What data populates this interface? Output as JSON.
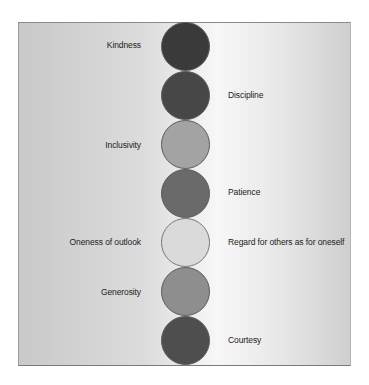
{
  "diagram": {
    "type": "vertical-stack-of-circles",
    "items": [
      {
        "label": "Kindness",
        "side": "left",
        "color": "#3a3a3a"
      },
      {
        "label": "Discipline",
        "side": "right",
        "color": "#474747"
      },
      {
        "label": "Inclusivity",
        "side": "left",
        "color": "#a3a3a3"
      },
      {
        "label": "Patience",
        "side": "right",
        "color": "#6a6a6a"
      },
      {
        "label": "Oneness of outlook",
        "side": "left",
        "color": "#dadada"
      },
      {
        "label": "Regard for others as for oneself",
        "side": "right",
        "color": "#dadada"
      },
      {
        "label": "Generosity",
        "side": "left",
        "color": "#8e8e8e"
      },
      {
        "label": "Courtesy",
        "side": "right",
        "color": "#4e4e4e"
      }
    ]
  }
}
